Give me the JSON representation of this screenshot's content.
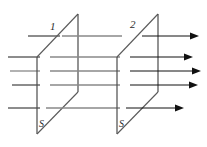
{
  "figure": {
    "type": "physics-flux-through-surfaces-diagram",
    "canvas": {
      "width": 207,
      "height": 147,
      "background": "#ffffff"
    },
    "labels": {
      "surface_one": "1",
      "surface_two": "2",
      "area_one": "S",
      "area_two": "S"
    },
    "colors": {
      "plane_stroke": "#5a5a5a",
      "flux_line": "#888888",
      "flux_line_dark": "#1a1a1a",
      "arrow": "#111111"
    },
    "surfaces": [
      {
        "name": "surface-1",
        "label": "1",
        "area_label": "S",
        "shape": "parallelogram",
        "left_edge_x": 37,
        "right_edge_x": 78,
        "top_y": 14,
        "bottom_y": 134,
        "skew": 41
      },
      {
        "name": "surface-2",
        "label": "2",
        "area_label": "S",
        "shape": "parallelogram",
        "left_edge_x": 117,
        "right_edge_x": 158,
        "top_y": 14,
        "bottom_y": 134,
        "skew": 41
      }
    ],
    "flux_lines": {
      "count": 5,
      "rows_y": [
        36,
        57,
        71,
        85,
        108
      ],
      "direction": "left-to-right"
    },
    "arrows": {
      "count": 5,
      "tips_x": [
        196,
        190,
        199,
        196,
        182
      ],
      "rows_y": [
        36,
        57,
        71,
        85,
        108
      ],
      "direction": "right"
    }
  }
}
